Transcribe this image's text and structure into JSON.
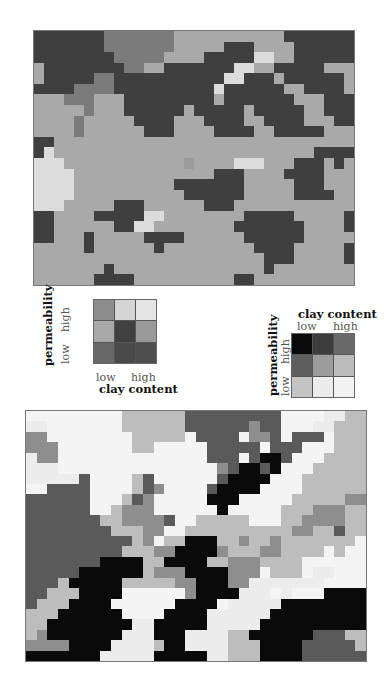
{
  "palette_top": {
    "a": "#3f3f3f",
    "b": "#a9a9a9",
    "c": "#9b9b9b",
    "d": "#7b7b7b",
    "e": "#dcdcdc",
    "f": "#b6b6b6"
  },
  "palette_bottom": {
    "k": "#0a0a0a",
    "g": "#5a5a5a",
    "m": "#8e8e8e",
    "l": "#bdbdbd",
    "w": "#ececec",
    "v": "#f4f4f4"
  },
  "map_top": {
    "cols": 32,
    "rows": 24,
    "grid": [
      "aaaaaaadddddddbbbbbbbbbbbaaaaaaa",
      "aaaaaaadddddddbbbbbaaabbbbaaaaaa",
      "aaaaaaaadddddbbbbaaaaaeebbaaaaaa",
      "baaaaaaaaddbbaaaaaaaeebbaaaaabbb",
      "baaaaaddaaaaaaaaaaaeeaaabaaaaaab",
      "aaaaddddaaaaaaaaaaeaaaaaabbaaaab",
      "bbbdddbbbaaaaaaaaabaaaaaaabbbaaa",
      "bbbbbdbbbaaaaaabaaaaabaaaaabbaaa",
      "bbbbdbbbbbaaaabbbaaaabbaaaabbbaa",
      "bbbbdbbbbbbaaabbbbaaaabbaaaaabbb",
      "aabbbbbbbbbbbbbbbbbbbbbbbbbbbbbb",
      "aebbbbbbbbbbbbbbbbbbbbbbbbbbaaaa",
      "eeebbbbbbbbbbbbcbbbbeeebbbaaabab",
      "eeeebbbbbbbbbbbbbbaaabbbbaaaabbb",
      "eeeebbbbbbbbbbaaaaaaabbbbbaaabbb",
      "eeeebbbbbbbbbbbaaaaaabbbbbaaaabb",
      "eeebbbbbaaabbbbbbaaabbbbbbbbbbbb",
      "aabbbbaaaaaeebbbbbbbbaaaaabbbbba",
      "aabbbbbbaaeebbbbbbbbaaaaaaabbbba",
      "aabbbabbbbbaaaabbbbbbaaaaaabbbbb",
      "bbbbbabbbbbbabbbbbbbbbaaaabbbbba",
      "bbbbbbbbbbbbbbbbbbbbbbbaaabbbbba",
      "bbbbbbbabbbbbbbbbbbbbbbabbbbbbbb",
      "bbbbbbaaaabbbbbbbbbbaabbbbbbbbbb"
    ]
  },
  "map_bottom": {
    "cols": 32,
    "rows": 24,
    "grid": [
      "vvvvvvvvvllllllgggggggggvvvvwwll",
      "wwvvvvvvvllllllggggggmggvvvwwlll",
      "mmvvvvvvvvlllllvggggvmmgvgggvlll",
      "mmmvvvvvvvllvvvvvgggggvgggvvvlll",
      "wmmvvvvvvvvvvvvvvgggvgkkgvvvllll",
      "wwwvvvvvvvvvvvvvvvmgkkgkvvvlllll",
      "wwwwwgvvvvlgvvvvvvgkkkkvvvllllll",
      "vvggggvvvvlgmvvvvgkkkkvvvvllllll",
      "ggggggvvvlgmvvvvvkkkvvvvvlllllmm",
      "ggggggvvlmmmvvvvvvkvvvvvlllmmmll",
      "gggggggllmmmmgvvlllllvvvllmmmmll",
      "gggggggglllmmvvllllllllllmmllgll",
      "gggggggggglmvllkkkllmllmlllllllv",
      "ggggggggglllmmkkkkmlllmmllllvlvv",
      "gggggggkkkkllkkkkllmmmllllvvvvvv",
      "gggggkkkkkklmmmkkkkmmmvlllvwwvvv",
      "ggglkkkkklllllmmkkkmmwwwwwwwvvvv",
      "gglllkkkkvvvvvvmkkkkwwwvwvvvkkkk",
      "glllkkkkvvvvvvkkkkvwwwwwkkkkkkkk",
      "lllkkkkkkvvvvkkkkwwwwwwkkkkkkkkk",
      "llkkkkkkkkwwkkkkkwwwwwkkkkkkkkkk",
      "lmkkkkkkkwwwkkkwwwwllkkkkkkgggll",
      "mmmmkkkkwwwwlkkwwwwlllkkkkgggggl",
      "kkkkkkkwwwwwkkkkkwwlllkkkkgggggg"
    ]
  },
  "legend_left": {
    "title_x": "clay content",
    "title_y": "permeability",
    "x_low": "low",
    "x_high": "high",
    "y_low": "low",
    "y_high": "high",
    "cells": [
      [
        "#8c8c8c",
        "#d4d4d4",
        "#e4e4e4"
      ],
      [
        "#a8a8a8",
        "#404040",
        "#9a9a9a"
      ],
      [
        "#686868",
        "#4a4a4a",
        "#4e4e4e"
      ]
    ]
  },
  "legend_right": {
    "title_x": "clay content",
    "title_y": "permeability",
    "x_low": "low",
    "x_high": "high",
    "y_low": "low",
    "y_high": "high",
    "cells": [
      [
        "#0a0a0a",
        "#3c3c3c",
        "#6a6a6a"
      ],
      [
        "#5e5e5e",
        "#9c9c9c",
        "#bcbcbc"
      ],
      [
        "#c4c4c4",
        "#ececec",
        "#f2f2f2"
      ]
    ]
  }
}
